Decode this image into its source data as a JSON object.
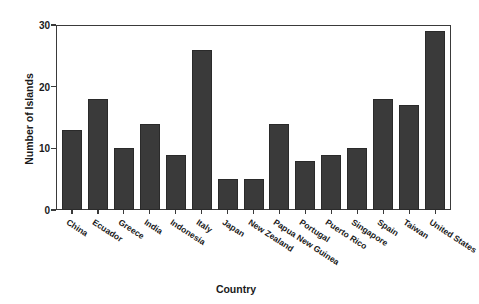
{
  "chart_data": {
    "type": "bar",
    "title": "",
    "xlabel": "Country",
    "ylabel": "Number of Islands",
    "ylim": [
      0,
      30
    ],
    "yticks": [
      0,
      10,
      20,
      30
    ],
    "grid": false,
    "legend": null,
    "bar_color": "#3a3a3a",
    "categories": [
      "China",
      "Ecuador",
      "Greece",
      "India",
      "Indonesia",
      "Italy",
      "Japan",
      "New Zealand",
      "Papua New Guinea",
      "Portugal",
      "Puerto Rico",
      "Singapore",
      "Spain",
      "Taiwan",
      "United States"
    ],
    "values": [
      13,
      18,
      10,
      14,
      9,
      26,
      5,
      5,
      14,
      8,
      9,
      10,
      18,
      17,
      29
    ]
  }
}
